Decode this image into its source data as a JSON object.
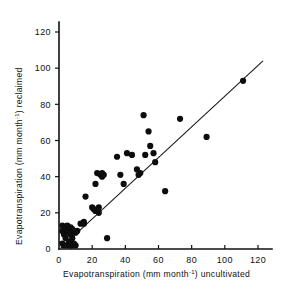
{
  "chart_data": {
    "type": "scatter",
    "title": "",
    "xlabel": "Evapotranspiration (mm month-1) uncultivated",
    "ylabel": "Evapotranspiration (mm month-1) reclaimed",
    "xlabel_parts": {
      "lead": "Evapotranspiration (mm",
      "mid": "month",
      "sup": "-1",
      "tail": ") uncultivated"
    },
    "ylabel_parts": {
      "lead": "Evapotranspiration (mm month",
      "sup": "-1",
      "tail": ") reclaimed"
    },
    "xlim": [
      0,
      128
    ],
    "ylim": [
      0,
      128
    ],
    "xticks": [
      0,
      20,
      40,
      60,
      80,
      100,
      120
    ],
    "yticks": [
      0,
      20,
      40,
      60,
      80,
      100,
      120
    ],
    "xticklabels": [
      "0",
      "20",
      "40",
      "60",
      "80",
      "100",
      "120"
    ],
    "yticklabels": [
      "0",
      "20",
      "40",
      "60",
      "80",
      "100",
      "120"
    ],
    "grid": false,
    "legend": "none",
    "marker": "filled-circle",
    "marker_color": "#0d0d0d",
    "marker_size_px": 3.1,
    "series": [
      {
        "name": "sites",
        "points": [
          [
            2,
            13
          ],
          [
            2,
            10
          ],
          [
            2,
            3
          ],
          [
            3,
            8
          ],
          [
            3,
            2
          ],
          [
            4,
            11
          ],
          [
            4,
            6
          ],
          [
            5,
            13
          ],
          [
            5,
            10
          ],
          [
            5,
            2
          ],
          [
            6,
            9
          ],
          [
            6,
            4
          ],
          [
            7,
            12
          ],
          [
            7,
            8
          ],
          [
            7,
            2
          ],
          [
            8,
            11
          ],
          [
            8,
            6
          ],
          [
            8,
            2
          ],
          [
            9,
            10
          ],
          [
            9,
            3
          ],
          [
            10,
            9
          ],
          [
            10,
            2
          ],
          [
            11,
            10
          ],
          [
            13,
            14
          ],
          [
            15,
            15
          ],
          [
            15,
            14
          ],
          [
            16,
            29
          ],
          [
            20,
            23
          ],
          [
            21,
            22
          ],
          [
            22,
            36
          ],
          [
            22,
            21
          ],
          [
            23,
            42
          ],
          [
            24,
            23
          ],
          [
            24,
            20
          ],
          [
            25,
            41
          ],
          [
            26,
            42
          ],
          [
            26,
            40
          ],
          [
            27,
            41
          ],
          [
            29,
            6
          ],
          [
            35,
            51
          ],
          [
            37,
            41
          ],
          [
            39,
            36
          ],
          [
            41,
            53
          ],
          [
            44,
            52
          ],
          [
            47,
            44
          ],
          [
            48,
            41
          ],
          [
            49,
            42
          ],
          [
            51,
            74
          ],
          [
            52,
            52
          ],
          [
            54,
            65
          ],
          [
            55,
            57
          ],
          [
            57,
            53
          ],
          [
            58,
            48
          ],
          [
            64,
            32
          ],
          [
            73,
            72
          ],
          [
            89,
            62
          ],
          [
            111,
            93
          ]
        ]
      }
    ],
    "fit_line": {
      "name": "regression-line",
      "x0": 1.0,
      "y0": 0.5,
      "x1": 123.0,
      "y1": 104.0,
      "color": "#1a1a1a"
    }
  }
}
